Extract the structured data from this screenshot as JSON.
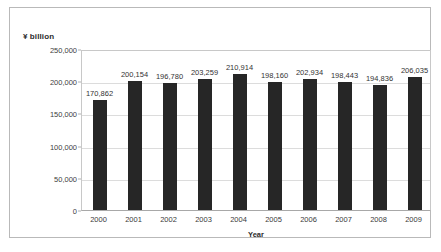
{
  "chart_data": {
    "type": "bar",
    "title": "",
    "xlabel": "Year",
    "ylabel": "¥ billion",
    "categories": [
      "2000",
      "2001",
      "2002",
      "2003",
      "2004",
      "2005",
      "2006",
      "2007",
      "2008",
      "2009"
    ],
    "values": [
      170862,
      200154,
      196780,
      203259,
      210914,
      198160,
      202934,
      198443,
      194836,
      206035
    ],
    "value_labels": [
      "170,862",
      "200,154",
      "196,780",
      "203,259",
      "210,914",
      "198,160",
      "202,934",
      "198,443",
      "194,836",
      "206,035"
    ],
    "ylim": [
      0,
      250000
    ],
    "yticks": [
      0,
      50000,
      100000,
      150000,
      200000,
      250000
    ],
    "ytick_labels": [
      "0",
      "50,000",
      "100,000",
      "150,000",
      "200,000",
      "250,000"
    ],
    "grid": true,
    "legend": "none",
    "bar_color": "#262626",
    "gridline_color": "#dcdcdc",
    "plot_border_color": "#c8c8c8",
    "frame_border_color": "#b9b9b9",
    "background_color": "#ffffff",
    "label_text_color": "#333333"
  }
}
